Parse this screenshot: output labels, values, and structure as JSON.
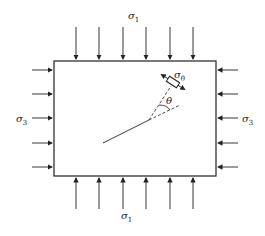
{
  "diagram": {
    "type": "stress-state-with-inclined-crack",
    "labels": {
      "top": "σ",
      "top_sub": "1",
      "bottom": "σ",
      "bottom_sub": "1",
      "left": "σ",
      "left_sub": "3",
      "right": "σ",
      "right_sub": "3",
      "element": "σ",
      "element_sub": "θ",
      "angle": "θ"
    },
    "box": {
      "x": 54,
      "y": 61,
      "w": 162,
      "h": 115
    },
    "top_arrows_x": [
      76,
      99,
      123,
      146,
      170,
      193
    ],
    "bottom_arrows_x": [
      76,
      99,
      123,
      146,
      170,
      193
    ],
    "side_arrows_y": [
      70,
      94,
      118,
      143,
      167
    ],
    "colors": {
      "stroke": "#222222",
      "background": "#ffffff"
    }
  }
}
